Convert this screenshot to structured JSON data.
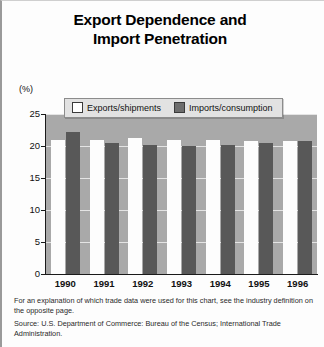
{
  "title": {
    "line1": "Export Dependence and",
    "line2": "Import Penetration"
  },
  "axis": {
    "unit_label": "(%)",
    "y_ticks": [
      "25",
      "20",
      "15",
      "10",
      "5",
      "0"
    ]
  },
  "legend": {
    "exports_label": "Exports/shipments",
    "imports_label": "Imports/consumption",
    "exports_color": "#ffffff",
    "imports_color": "#6d6d6d"
  },
  "notes": {
    "explanation": "For an explanation of which trade data were used for this chart, see the industry definition on the opposite page.",
    "source": "Source: U.S. Department of Commerce: Bureau of the Census; International Trade Administration."
  },
  "chart_data": {
    "type": "bar",
    "title": "Export Dependence and Import Penetration",
    "xlabel": "",
    "ylabel": "(%)",
    "ylim": [
      0,
      25
    ],
    "yticks": [
      0,
      5,
      10,
      15,
      20,
      25
    ],
    "grid": true,
    "legend_position": "top-center",
    "categories": [
      "1990",
      "1991",
      "1992",
      "1993",
      "1994",
      "1995",
      "1996"
    ],
    "series": [
      {
        "name": "Exports/shipments",
        "color": "#ffffff",
        "values": [
          21.0,
          21.0,
          21.2,
          21.0,
          21.0,
          20.8,
          20.8
        ]
      },
      {
        "name": "Imports/consumption",
        "color": "#585858",
        "values": [
          22.2,
          20.5,
          20.2,
          20.0,
          20.2,
          20.5,
          20.8
        ]
      }
    ]
  }
}
